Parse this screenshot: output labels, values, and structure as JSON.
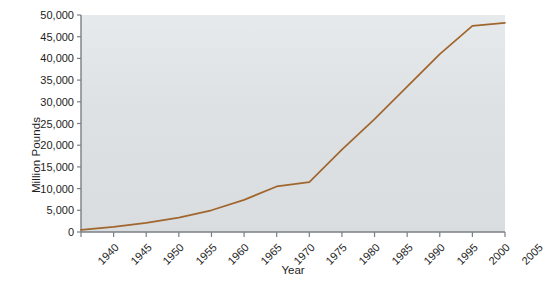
{
  "chart_data": {
    "type": "line",
    "title": "",
    "xlabel": "Year",
    "ylabel": "Million Pounds",
    "x": [
      1940,
      1945,
      1950,
      1955,
      1960,
      1965,
      1970,
      1975,
      1980,
      1985,
      1990,
      1995,
      2000,
      2005
    ],
    "values": [
      500,
      1200,
      2100,
      3300,
      5000,
      7400,
      10500,
      11500,
      19000,
      26000,
      33500,
      41000,
      47500,
      48200
    ],
    "xtick_labels": [
      "1940",
      "1945",
      "1950",
      "1955",
      "1960",
      "1965",
      "1970",
      "1975",
      "1980",
      "1985",
      "1990",
      "1995",
      "2000",
      "2005"
    ],
    "ytick_labels": [
      "0",
      "5,000",
      "10,000",
      "15,000",
      "20,000",
      "25,000",
      "30,000",
      "35,000",
      "40,000",
      "45,000",
      "50,000"
    ],
    "ytick_values": [
      0,
      5000,
      10000,
      15000,
      20000,
      25000,
      30000,
      35000,
      40000,
      45000,
      50000
    ],
    "xlim": [
      1940,
      2005
    ],
    "ylim": [
      0,
      50000
    ],
    "grid": false,
    "legend": null,
    "series": [
      {
        "name": "Million Pounds",
        "color": "#a0662e",
        "values": [
          500,
          1200,
          2100,
          3300,
          5000,
          7400,
          10500,
          11500,
          19000,
          26000,
          33500,
          41000,
          47500,
          48200
        ]
      }
    ],
    "plot_background": "#dde1e4",
    "axis_color": "#7a7f85",
    "text_color": "#1d1d1d"
  }
}
